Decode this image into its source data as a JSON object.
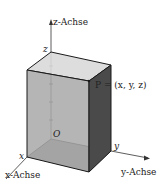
{
  "diagram": {
    "type": "3d-coordinate-box",
    "axes": {
      "x": {
        "label": "x-Achse",
        "tick_label": "x"
      },
      "y": {
        "label": "y-Achse",
        "tick_label": "y"
      },
      "z": {
        "label": "z-Achse",
        "tick_label": "z"
      }
    },
    "origin_label": "O",
    "point_label": "P = (x, y, z)",
    "colors": {
      "top_face": "#d9d9d9",
      "front_face": "#a8a8a8",
      "side_face": "#4a4a4a",
      "bottom_face": "#8f8f8f",
      "edge": "#1a1a1a",
      "axis": "#333333"
    }
  }
}
